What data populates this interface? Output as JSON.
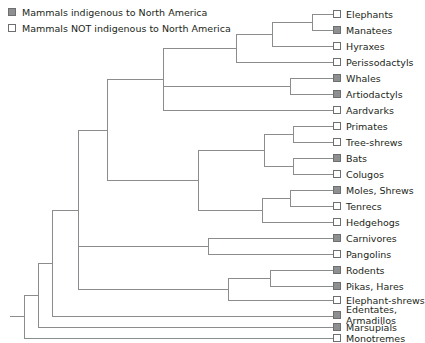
{
  "figure": {
    "background_color": "#ffffff",
    "line_color": "#8a8c8e",
    "text_color": "#231f20",
    "swatch_filled_color": "#8d8f91",
    "swatch_border_color": "#6d6e70"
  },
  "legend": {
    "items": [
      {
        "label": "Mammals indigenous to North America",
        "state": "filled"
      },
      {
        "label": "Mammals NOT indigenous to North America",
        "state": "open"
      }
    ]
  },
  "taxa": [
    {
      "label": "Elephants",
      "state": "open",
      "y": 14
    },
    {
      "label": "Manatees",
      "state": "filled",
      "y": 30
    },
    {
      "label": "Hyraxes",
      "state": "open",
      "y": 46
    },
    {
      "label": "Perissodactyls",
      "state": "open",
      "y": 62
    },
    {
      "label": "Whales",
      "state": "filled",
      "y": 78
    },
    {
      "label": "Artiodactyls",
      "state": "filled",
      "y": 94
    },
    {
      "label": "Aardvarks",
      "state": "open",
      "y": 110
    },
    {
      "label": "Primates",
      "state": "open",
      "y": 126
    },
    {
      "label": "Tree-shrews",
      "state": "open",
      "y": 142
    },
    {
      "label": "Bats",
      "state": "filled",
      "y": 158
    },
    {
      "label": "Colugos",
      "state": "open",
      "y": 174
    },
    {
      "label": "Moles, Shrews",
      "state": "filled",
      "y": 190
    },
    {
      "label": "Tenrecs",
      "state": "open",
      "y": 206
    },
    {
      "label": "Hedgehogs",
      "state": "open",
      "y": 222
    },
    {
      "label": "Carnivores",
      "state": "filled",
      "y": 238
    },
    {
      "label": "Pangolins",
      "state": "open",
      "y": 254
    },
    {
      "label": "Rodents",
      "state": "filled",
      "y": 270
    },
    {
      "label": "Pikas, Hares",
      "state": "filled",
      "y": 286
    },
    {
      "label": "Elephant-shrews",
      "state": "open",
      "y": 300
    },
    {
      "label": "Edentates, Armadillos",
      "state": "filled",
      "y": 311,
      "wrap": true
    },
    {
      "label": "Marsupials",
      "state": "filled",
      "y": 327
    },
    {
      "label": "Monotremes",
      "state": "open",
      "y": 343
    }
  ],
  "tree": {
    "tip_x": 333,
    "nodes": [
      {
        "name": "elephants-manatees",
        "x": 312
      },
      {
        "name": "paenungulata",
        "x": 272
      },
      {
        "name": "perissodactyl-join",
        "x": 236
      },
      {
        "name": "whales-artiodactyls",
        "x": 290
      },
      {
        "name": "afrotheria-laurasia",
        "x": 163
      },
      {
        "name": "primates-treeshrews",
        "x": 293
      },
      {
        "name": "bats-colugos",
        "x": 293
      },
      {
        "name": "euarchonta",
        "x": 264
      },
      {
        "name": "moles-tenrecs",
        "x": 290
      },
      {
        "name": "eulipotyphla",
        "x": 262
      },
      {
        "name": "euarchonta-eulipotyphla",
        "x": 198
      },
      {
        "name": "carnivores-pangolins",
        "x": 208
      },
      {
        "name": "rodents-pikas",
        "x": 270
      },
      {
        "name": "glires",
        "x": 228
      },
      {
        "name": "upper-clade",
        "x": 107
      },
      {
        "name": "afrotheria-node",
        "x": 78
      },
      {
        "name": "edentate-node",
        "x": 52
      },
      {
        "name": "marsupial-node",
        "x": 38
      },
      {
        "name": "root",
        "x": 24
      }
    ]
  }
}
